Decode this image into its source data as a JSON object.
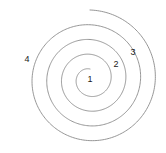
{
  "figure": {
    "background_color": "#ffffff",
    "width": 166,
    "height": 153
  },
  "spiral": {
    "stroke_color": "#8a8a8a",
    "stroke_width": 0.9,
    "center": {
      "x": 90,
      "y": 79
    },
    "turns": 4,
    "start_radius": 10,
    "end_radius": 69,
    "start_angle_deg": -90,
    "winding": "counterclockwise-outward",
    "inner_gap": true
  },
  "labels": [
    {
      "id": "label-1",
      "text": "1",
      "x": 90,
      "y": 79,
      "turn": 1,
      "description": "innermost turn"
    },
    {
      "id": "label-2",
      "text": "2",
      "x": 116,
      "y": 64,
      "turn": 2,
      "description": "second turn"
    },
    {
      "id": "label-3",
      "text": "3",
      "x": 133,
      "y": 52,
      "turn": 3,
      "description": "third turn"
    },
    {
      "id": "label-4",
      "text": "4",
      "x": 27,
      "y": 59,
      "turn": 4,
      "description": "outermost turn"
    }
  ],
  "chart_data": {
    "type": "line",
    "xlabel": "",
    "ylabel": "",
    "series": [
      {
        "name": "archimedean-spiral",
        "description": "Single continuous spiral curve making four outward revolutions",
        "center": [
          90,
          79
        ],
        "radius_start": 10,
        "radius_end": 69
      }
    ],
    "annotations": [
      {
        "text": "1",
        "x": 90,
        "y": 79
      },
      {
        "text": "2",
        "x": 116,
        "y": 64
      },
      {
        "text": "3",
        "x": 133,
        "y": 52
      },
      {
        "text": "4",
        "x": 27,
        "y": 59
      }
    ],
    "grid": false,
    "legend": "none"
  }
}
